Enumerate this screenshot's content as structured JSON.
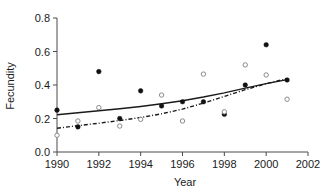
{
  "chart_data": {
    "type": "scatter",
    "title": "",
    "xlabel": "Year",
    "ylabel": "Fecundity",
    "xlim": [
      1990,
      2002
    ],
    "ylim": [
      0.0,
      0.8
    ],
    "xticks": [
      1990,
      1992,
      1994,
      1996,
      1998,
      2000,
      2002
    ],
    "xtick_labels": [
      "1990",
      "1992",
      "1994",
      "1996",
      "1998",
      "2000",
      "2002"
    ],
    "yticks": [
      0.0,
      0.2,
      0.4,
      0.6,
      0.8
    ],
    "ytick_labels": [
      "0.0",
      "0.2",
      "0.4",
      "0.6",
      "0.8"
    ],
    "grid": false,
    "legend": "none",
    "series": [
      {
        "name": "filled-circles",
        "marker": "filled-circle",
        "color": "#111111",
        "x": [
          1990,
          1991,
          1992,
          1993,
          1994,
          1995,
          1996,
          1997,
          1998,
          1999,
          2000,
          2001
        ],
        "values": [
          0.25,
          0.15,
          0.48,
          0.2,
          0.365,
          0.275,
          0.3,
          0.3,
          0.225,
          0.4,
          0.64,
          0.43
        ]
      },
      {
        "name": "open-circles",
        "marker": "open-circle",
        "color": "#8a8a8a",
        "x": [
          1990,
          1991,
          1992,
          1993,
          1994,
          1995,
          1996,
          1997,
          1998,
          1999,
          2000,
          2001
        ],
        "values": [
          0.1,
          0.185,
          0.265,
          0.155,
          0.195,
          0.34,
          0.185,
          0.465,
          0.24,
          0.52,
          0.46,
          0.315
        ]
      }
    ],
    "fits": [
      {
        "name": "solid-trend-line",
        "style": "solid",
        "color": "#1a1a1a",
        "x": [
          1990,
          1991,
          1992,
          1993,
          1994,
          1995,
          1996,
          1997,
          1998,
          1999,
          2000,
          2001
        ],
        "values": [
          0.222,
          0.234,
          0.246,
          0.258,
          0.272,
          0.288,
          0.306,
          0.328,
          0.353,
          0.381,
          0.408,
          0.432
        ]
      },
      {
        "name": "dash-dot-trend-line",
        "style": "dash-dot",
        "color": "#1a1a1a",
        "x": [
          1990,
          1991,
          1992,
          1993,
          1994,
          1995,
          1996,
          1997,
          1998,
          1999,
          2000,
          2001
        ],
        "values": [
          0.142,
          0.157,
          0.172,
          0.188,
          0.206,
          0.228,
          0.256,
          0.292,
          0.332,
          0.372,
          0.408,
          0.438
        ]
      }
    ]
  }
}
